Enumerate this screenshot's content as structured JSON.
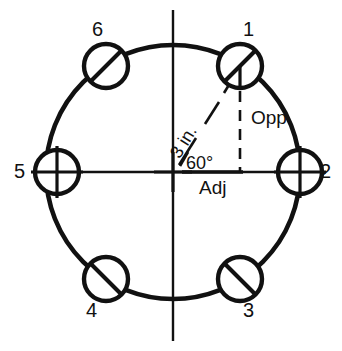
{
  "diagram": {
    "type": "engineering-drawing",
    "colors": {
      "background": "#ffffff",
      "ink": "#111111"
    },
    "bolt_circle": {
      "center": {
        "x": 173,
        "y": 172
      },
      "radius": 127,
      "hole_radius": 22,
      "hole_count": 6,
      "angular_pitch_degrees": 60
    },
    "holes": [
      {
        "id": "1",
        "label": "1",
        "angle_degrees": 60,
        "cx": 240,
        "cy": 66,
        "mark": "slash",
        "label_x": 243,
        "label_y": 19
      },
      {
        "id": "2",
        "label": "2",
        "angle_degrees": 0,
        "cx": 300,
        "cy": 172,
        "mark": "crosshair",
        "label_x": 320,
        "label_y": 161
      },
      {
        "id": "3",
        "label": "3",
        "angle_degrees": -60,
        "cx": 240,
        "cy": 279,
        "mark": "slash",
        "label_x": 243,
        "label_y": 300
      },
      {
        "id": "4",
        "label": "4",
        "angle_degrees": 240,
        "cx": 106,
        "cy": 279,
        "mark": "slash",
        "label_x": 86,
        "label_y": 300
      },
      {
        "id": "5",
        "label": "5",
        "angle_degrees": 180,
        "cx": 57,
        "cy": 172,
        "mark": "crosshair",
        "label_x": 14,
        "label_y": 161
      },
      {
        "id": "6",
        "label": "6",
        "angle_degrees": 120,
        "cx": 106,
        "cy": 66,
        "mark": "slash",
        "label_x": 92,
        "label_y": 19
      }
    ],
    "annotations": {
      "radius_dimension": {
        "text": "3 in.",
        "rotation_degrees": -58,
        "x": 182,
        "y": 143
      },
      "angle": {
        "text": "60°",
        "x": 186,
        "y": 154
      },
      "opposite_side": {
        "text": "Opp",
        "x": 251,
        "y": 108
      },
      "adjacent_side": {
        "text": "Adj",
        "x": 199,
        "y": 178
      }
    },
    "centerlines": {
      "vertical": {
        "x": 173,
        "y_top": 10,
        "y_bottom": 341
      },
      "horizontal": {
        "y": 172,
        "x_left": 35,
        "x_right": 322
      }
    },
    "construction": {
      "hypotenuse": {
        "from": "center",
        "to": "hole-1",
        "style": "dashed"
      },
      "opposite_leg": {
        "from": "hole-1",
        "to": "adjacent-foot",
        "style": "dashed"
      },
      "adjacent_leg": {
        "from": "center",
        "to": "adjacent-foot",
        "style": "solid"
      }
    }
  }
}
